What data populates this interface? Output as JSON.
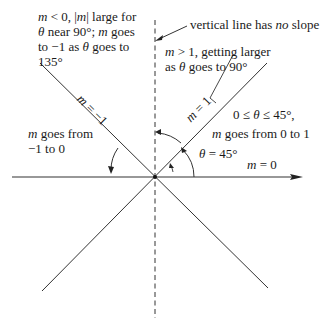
{
  "diagram": {
    "lines": [
      {
        "id": "horizontal",
        "label": "m = 0"
      },
      {
        "id": "vertical",
        "label": "vertical line has no slope"
      },
      {
        "id": "diag-up",
        "label": "m = 1"
      },
      {
        "id": "diag-down",
        "label": "m = −1"
      }
    ],
    "labels": {
      "vertical_note_a": "vertical line has ",
      "vertical_note_b": "no",
      "vertical_note_c": " slope",
      "top_left_1a": "m",
      "top_left_1b": " < 0, |",
      "top_left_1c": "m",
      "top_left_1d": "| large for",
      "top_left_2a": "θ",
      "top_left_2b": " near 90°; ",
      "top_left_2c": "m",
      "top_left_2d": " goes",
      "top_left_3a": "to −1 as ",
      "top_left_3b": "θ",
      "top_left_3c": " goes to",
      "top_left_4": "135°",
      "top_right_1a": "m",
      "top_right_1b": " > 1, getting larger",
      "top_right_2a": "as ",
      "top_right_2b": "θ",
      "top_right_2c": " goes to 90°",
      "right_1a": "0 ≤ ",
      "right_1b": "θ",
      "right_1c": " ≤ 45°,",
      "right_2a": "m",
      "right_2b": " goes from 0 to 1",
      "theta_a": "θ",
      "theta_b": " = 45°",
      "m0_a": "m",
      "m0_b": " = 0",
      "left_1a": "m",
      "left_1b": " goes from",
      "left_2": "−1 to 0",
      "m1_a": "m",
      "m1_b": " = 1",
      "mneg1_a": "m",
      "mneg1_b": " = −1"
    }
  }
}
